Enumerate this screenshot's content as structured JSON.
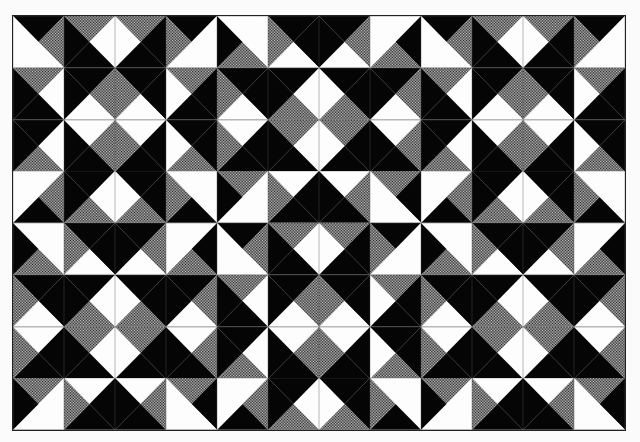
{
  "colors": {
    "K": "#050505",
    "W": "#fdfdfd",
    "G": "url(#halftone)",
    "line": "#555555"
  },
  "grid": {
    "cols": 12,
    "rows": 8,
    "cell_w": 51,
    "cell_h": 51.75
  },
  "block_layout": [
    [
      "A",
      "B",
      "A"
    ],
    [
      "B",
      "A",
      "B"
    ]
  ],
  "blocks": {
    "A": [
      [
        [
          "K",
          "G",
          "W",
          "W"
        ],
        [
          "G",
          "W",
          "K",
          "K"
        ],
        [
          "G",
          "K",
          "K",
          "W"
        ],
        [
          "K",
          "W",
          "W",
          "G"
        ]
      ],
      [
        [
          "G",
          "W",
          "K",
          "K"
        ],
        [
          "K",
          "G",
          "W",
          "K"
        ],
        [
          "K",
          "K",
          "W",
          "G"
        ],
        [
          "G",
          "K",
          "K",
          "W"
        ]
      ],
      [
        [
          "K",
          "W",
          "G",
          "K"
        ],
        [
          "W",
          "G",
          "K",
          "K"
        ],
        [
          "W",
          "K",
          "K",
          "G"
        ],
        [
          "K",
          "K",
          "G",
          "W"
        ]
      ],
      [
        [
          "W",
          "G",
          "K",
          "W"
        ],
        [
          "K",
          "W",
          "G",
          "K"
        ],
        [
          "K",
          "K",
          "G",
          "W"
        ],
        [
          "W",
          "W",
          "K",
          "G"
        ]
      ]
    ],
    "B": [
      [
        [
          "W",
          "W",
          "G",
          "K"
        ],
        [
          "K",
          "K",
          "W",
          "G"
        ],
        [
          "K",
          "G",
          "W",
          "K"
        ],
        [
          "W",
          "K",
          "G",
          "W"
        ]
      ],
      [
        [
          "K",
          "K",
          "W",
          "G"
        ],
        [
          "K",
          "W",
          "G",
          "K"
        ],
        [
          "K",
          "K",
          "G",
          "W"
        ],
        [
          "K",
          "G",
          "W",
          "K"
        ]
      ],
      [
        [
          "W",
          "K",
          "K",
          "G"
        ],
        [
          "G",
          "W",
          "K",
          "K"
        ],
        [
          "G",
          "K",
          "K",
          "W"
        ],
        [
          "W",
          "G",
          "K",
          "K"
        ]
      ],
      [
        [
          "G",
          "W",
          "W",
          "K"
        ],
        [
          "W",
          "K",
          "K",
          "G"
        ],
        [
          "W",
          "G",
          "K",
          "K"
        ],
        [
          "G",
          "K",
          "W",
          "W"
        ]
      ]
    ]
  },
  "triangle_order": [
    "top",
    "right",
    "bottom",
    "left"
  ]
}
